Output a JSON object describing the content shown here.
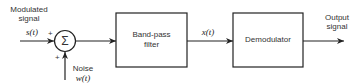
{
  "diagram": {
    "type": "block-diagram",
    "inputs": {
      "signal_label_line1": "Modulated",
      "signal_label_line2": "signal",
      "signal_symbol": "s(t)",
      "noise_label": "Noise",
      "noise_symbol": "w(t)"
    },
    "summer": {
      "symbol": "Σ",
      "plus_top": "+",
      "plus_bottom": "+"
    },
    "blocks": [
      {
        "id": "bandpass",
        "line1": "Band-pass",
        "line2": "filter"
      },
      {
        "id": "demodulator",
        "line1": "Demodulator"
      }
    ],
    "intermediate_symbol": "x(t)",
    "output": {
      "label_line1": "Output",
      "label_line2": "signal"
    },
    "colors": {
      "stroke": "#222222",
      "background": "#ffffff"
    }
  }
}
